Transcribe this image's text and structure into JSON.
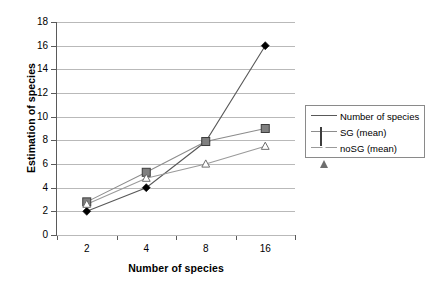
{
  "chart_data": {
    "type": "line",
    "title": "",
    "xlabel": "Number of species",
    "ylabel": "Estimation of species",
    "categories": [
      "2",
      "4",
      "8",
      "16"
    ],
    "xtick_labels": [
      "2",
      "4",
      "8",
      "16"
    ],
    "ytick_labels": [
      "0",
      "2",
      "4",
      "6",
      "8",
      "10",
      "12",
      "14",
      "16",
      "18"
    ],
    "ylim": [
      0,
      18
    ],
    "ytick_step": 2,
    "grid": true,
    "legend_position": "right",
    "series": [
      {
        "name": "Number of species",
        "marker": "diamond",
        "color": "#000000",
        "line_color": "#595959",
        "values": [
          2,
          4,
          7.9,
          16
        ]
      },
      {
        "name": "SG (mean)",
        "marker": "square",
        "color": "#808080",
        "line_color": "#8c8c8c",
        "values": [
          2.8,
          5.3,
          7.9,
          9.0
        ]
      },
      {
        "name": "noSG (mean)",
        "marker": "triangle",
        "color": "#ffffff",
        "line_color": "#9a9a9a",
        "values": [
          2.6,
          4.8,
          6.0,
          7.5
        ]
      }
    ]
  },
  "legend": {
    "entries": [
      {
        "label": "Number of species"
      },
      {
        "label": "SG (mean)"
      },
      {
        "label": "noSG (mean)"
      }
    ]
  },
  "colors": {
    "grid": "#b9b9b9",
    "axis": "#5a5a5a",
    "background": "#ffffff",
    "legend_border": "#8a8a8a"
  }
}
